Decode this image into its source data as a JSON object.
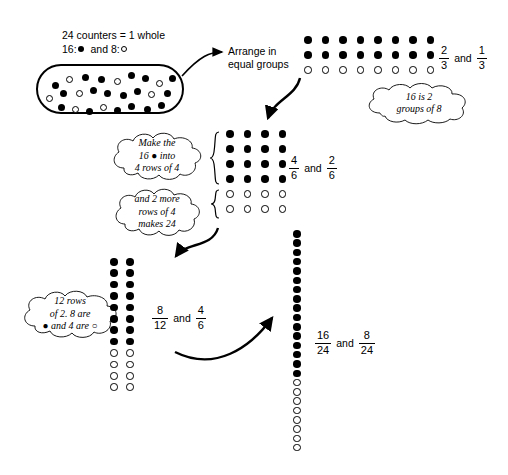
{
  "diagram": {
    "title_lines": [
      "24 counters = 1 whole",
      "16:",
      "and 8:"
    ],
    "header": {
      "line1": "24 counters = 1 whole",
      "line2_prefix": "16:",
      "line2_mid": "and 8:",
      "filled_count": "16",
      "open_count": "8",
      "total": "24"
    },
    "step_label": {
      "line1": "Arrange in",
      "line2": "equal groups"
    },
    "clouds": [
      {
        "name": "sixteen-is-two-groups",
        "lines": [
          "16 is 2",
          "groups of 8"
        ]
      },
      {
        "name": "make-16-into-4-rows",
        "lines": [
          "Make the",
          "16 ● into",
          "4 rows of 4"
        ]
      },
      {
        "name": "two-more-rows-of-4",
        "lines": [
          "and 2 more",
          "rows of 4",
          "makes 24"
        ]
      },
      {
        "name": "twelve-rows-of-2",
        "lines": [
          "12 rows",
          "of 2.  8 are",
          "● and 4 are ○"
        ]
      }
    ],
    "fraction_labels": [
      {
        "name": "two-thirds-one-third",
        "first": {
          "num": "2",
          "den": "3"
        },
        "conj": "and",
        "second": {
          "num": "1",
          "den": "3"
        }
      },
      {
        "name": "four-sixths-two-sixths",
        "first": {
          "num": "4",
          "den": "6"
        },
        "conj": "and",
        "second": {
          "num": "2",
          "den": "6"
        }
      },
      {
        "name": "eight-twelfths-four-sixths",
        "first": {
          "num": "8",
          "den": "12"
        },
        "conj": "and",
        "second": {
          "num": "4",
          "den": "6"
        }
      },
      {
        "name": "sixteen-24ths-eight-24ths",
        "first": {
          "num": "16",
          "den": "24"
        },
        "conj": "and",
        "second": {
          "num": "8",
          "den": "24"
        }
      }
    ],
    "arrays": [
      {
        "name": "array-8-by-3",
        "cols": 8,
        "rows": 3,
        "filled_rows": 2,
        "open_rows": 1,
        "filled_total": 16,
        "open_total": 8
      },
      {
        "name": "array-4-by-6",
        "cols": 4,
        "rows": 6,
        "filled_rows": 4,
        "open_rows": 2,
        "filled_total": 16,
        "open_total": 8
      },
      {
        "name": "array-2-by-12",
        "cols": 2,
        "rows": 12,
        "filled_rows": 8,
        "open_rows": 4,
        "filled_total": 16,
        "open_total": 8
      },
      {
        "name": "array-1-by-24",
        "cols": 1,
        "rows": 24,
        "filled_rows": 16,
        "open_rows": 8,
        "filled_total": 16,
        "open_total": 8
      }
    ],
    "scattered_counters": {
      "name": "oval-of-counters",
      "filled": 16,
      "open": 8,
      "positions": [
        [
          14,
          16,
          "f"
        ],
        [
          28,
          10,
          "o"
        ],
        [
          44,
          8,
          "f"
        ],
        [
          60,
          10,
          "f"
        ],
        [
          76,
          12,
          "o"
        ],
        [
          90,
          6,
          "f"
        ],
        [
          104,
          9,
          "f"
        ],
        [
          118,
          14,
          "o"
        ],
        [
          131,
          9,
          "f"
        ],
        [
          8,
          29,
          "o"
        ],
        [
          22,
          24,
          "f"
        ],
        [
          38,
          24,
          "o"
        ],
        [
          52,
          21,
          "f"
        ],
        [
          66,
          24,
          "f"
        ],
        [
          82,
          26,
          "f"
        ],
        [
          96,
          22,
          "f"
        ],
        [
          110,
          25,
          "o"
        ],
        [
          126,
          24,
          "f"
        ],
        [
          20,
          38,
          "f"
        ],
        [
          34,
          40,
          "o"
        ],
        [
          48,
          42,
          "f"
        ],
        [
          62,
          38,
          "o"
        ],
        [
          76,
          41,
          "f"
        ],
        [
          90,
          37,
          "f"
        ],
        [
          106,
          40,
          "f"
        ],
        [
          120,
          36,
          "f"
        ]
      ]
    }
  }
}
